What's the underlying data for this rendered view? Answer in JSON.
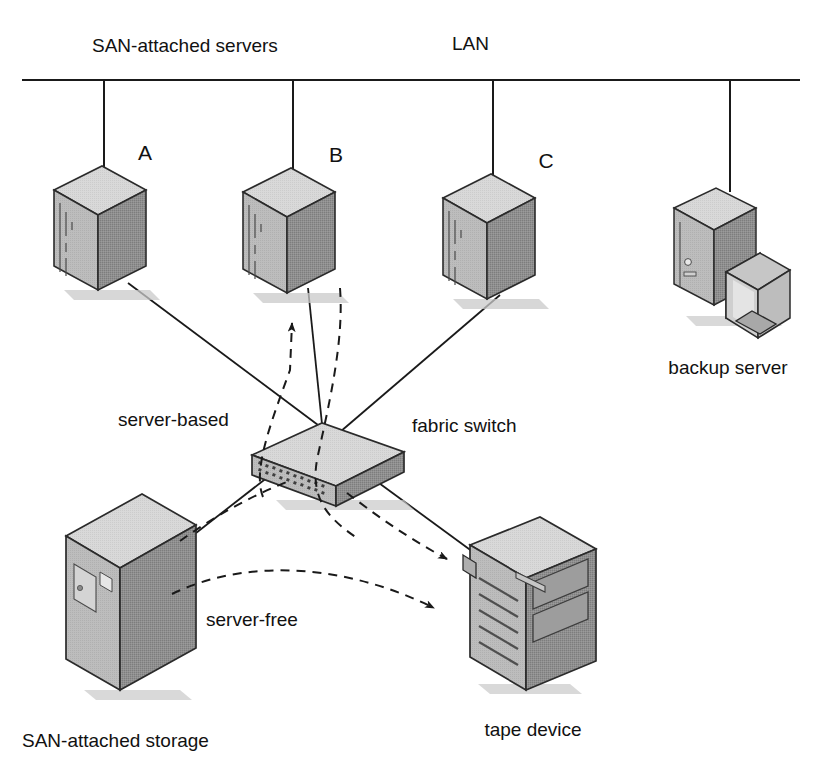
{
  "diagram": {
    "title_labels": {
      "san_servers": "SAN-attached servers",
      "lan": "LAN"
    },
    "servers": [
      {
        "id": "A",
        "letter": "A"
      },
      {
        "id": "B",
        "letter": "B"
      },
      {
        "id": "C",
        "letter": "C"
      }
    ],
    "nodes": {
      "backup_server": "backup server",
      "fabric_switch": "fabric switch",
      "tape_device": "tape device",
      "san_storage": "SAN-attached storage"
    },
    "flows": {
      "server_based": "server-based",
      "server_free": "server-free"
    },
    "colors": {
      "line": "#1a1a1a",
      "text": "#111111",
      "face_top": "#d7d7d7",
      "face_front": "#8f8f8f",
      "face_side": "#bcbcbc",
      "edge": "#2b2b2b",
      "shadow": "#c9c9c9",
      "background": "#ffffff"
    }
  }
}
